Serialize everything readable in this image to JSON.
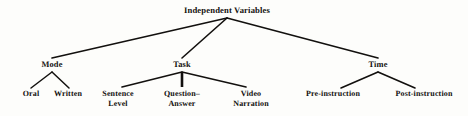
{
  "diagram": {
    "title": "Independent Variables",
    "type": "hierarchy-tree",
    "background_color": "#fdfdfb",
    "edge_color": "#12100e",
    "text_color": "#12100e",
    "root": {
      "id": "independent-variables",
      "label": "Independent Variables",
      "x": 227,
      "y": 12
    },
    "branches": [
      {
        "id": "mode",
        "label": "Mode",
        "x": 52,
        "y": 66,
        "children": [
          {
            "id": "oral",
            "label": "Oral",
            "lines": [
              "Oral"
            ],
            "x": 31,
            "y": 95
          },
          {
            "id": "written",
            "label": "Written",
            "lines": [
              "Written"
            ],
            "x": 68,
            "y": 95
          }
        ]
      },
      {
        "id": "task",
        "label": "Task",
        "x": 182,
        "y": 66,
        "children": [
          {
            "id": "sentence-level",
            "label": "Sentence Level",
            "lines": [
              "Sentence",
              "Level"
            ],
            "x": 118,
            "y": 95
          },
          {
            "id": "question-answer",
            "label": "Question–Answer",
            "lines": [
              "Question–",
              "Answer"
            ],
            "x": 182,
            "y": 95
          },
          {
            "id": "video-narration",
            "label": "Video Narration",
            "lines": [
              "Video",
              "Narration"
            ],
            "x": 251,
            "y": 95
          }
        ]
      },
      {
        "id": "time",
        "label": "Time",
        "x": 378,
        "y": 66,
        "children": [
          {
            "id": "pre-instruction",
            "label": "Pre-instruction",
            "lines": [
              "Pre-instruction"
            ],
            "x": 333,
            "y": 95
          },
          {
            "id": "post-instruction",
            "label": "Post-instruction",
            "lines": [
              "Post-instruction"
            ],
            "x": 424,
            "y": 95
          }
        ]
      }
    ],
    "edges": [
      {
        "id": "edge-root-mode",
        "from": "independent-variables",
        "to": "mode",
        "x1": 227,
        "y1": 18,
        "x2": 52,
        "y2": 58,
        "width": 1.6
      },
      {
        "id": "edge-root-task",
        "from": "independent-variables",
        "to": "task",
        "x1": 227,
        "y1": 18,
        "x2": 182,
        "y2": 58,
        "width": 1.6
      },
      {
        "id": "edge-root-time",
        "from": "independent-variables",
        "to": "time",
        "x1": 227,
        "y1": 18,
        "x2": 378,
        "y2": 58,
        "width": 1.6
      },
      {
        "id": "edge-mode-oral",
        "from": "mode",
        "to": "oral",
        "x1": 52,
        "y1": 72,
        "x2": 31,
        "y2": 88,
        "width": 1.5
      },
      {
        "id": "edge-mode-written",
        "from": "mode",
        "to": "written",
        "x1": 52,
        "y1": 72,
        "x2": 69,
        "y2": 88,
        "width": 1.5
      },
      {
        "id": "edge-task-sentence",
        "from": "task",
        "to": "sentence-level",
        "x1": 182,
        "y1": 72,
        "x2": 122,
        "y2": 87,
        "width": 1.6
      },
      {
        "id": "edge-task-question",
        "from": "task",
        "to": "question-answer",
        "x1": 182,
        "y1": 72,
        "x2": 182,
        "y2": 87,
        "width": 2.6
      },
      {
        "id": "edge-task-video",
        "from": "task",
        "to": "video-narration",
        "x1": 182,
        "y1": 72,
        "x2": 246,
        "y2": 87,
        "width": 1.6
      },
      {
        "id": "edge-time-pre",
        "from": "time",
        "to": "pre-instruction",
        "x1": 378,
        "y1": 72,
        "x2": 341,
        "y2": 88,
        "width": 1.6
      },
      {
        "id": "edge-time-post",
        "from": "time",
        "to": "post-instruction",
        "x1": 378,
        "y1": 72,
        "x2": 415,
        "y2": 88,
        "width": 1.6
      }
    ]
  }
}
